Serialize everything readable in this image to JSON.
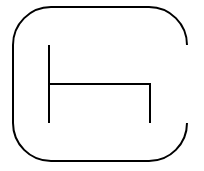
{
  "diagram": {
    "stroke_color": "#000000",
    "background_color": "#ffffff",
    "stroke_width": 2,
    "outer_frame": {
      "left": 13,
      "top": 7,
      "right": 187,
      "bottom": 161,
      "corner_radius": 38,
      "gap_side": "right",
      "gap_from_y": 45,
      "gap_to_y": 123
    },
    "inner_shape": {
      "left_vertical": {
        "x": 49,
        "y1": 45,
        "y2": 123
      },
      "horizontal": {
        "y": 84,
        "x1": 49,
        "x2": 150
      },
      "right_vertical": {
        "x": 150,
        "y1": 84,
        "y2": 123
      }
    }
  }
}
